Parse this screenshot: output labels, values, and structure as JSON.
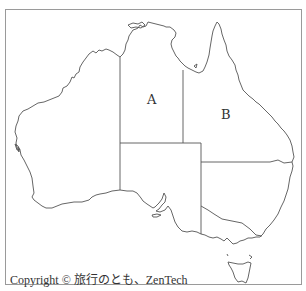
{
  "map": {
    "subject": "Australia outline map with state borders",
    "regions": [
      {
        "id": "A",
        "label": "A",
        "position": {
          "x": 152,
          "y": 100
        }
      },
      {
        "id": "B",
        "label": "B",
        "position": {
          "x": 226,
          "y": 115
        }
      }
    ],
    "colors": {
      "line": "#555555",
      "frame": "#9a9a9a",
      "background": "#ffffff"
    }
  },
  "footer": {
    "copyright": "Copyright © 旅行のとも、ZenTech"
  }
}
